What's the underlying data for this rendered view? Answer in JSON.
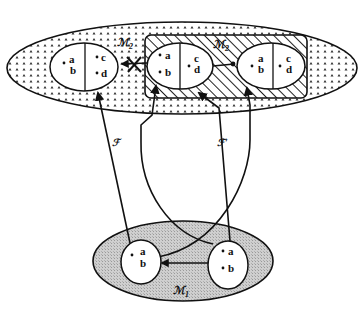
{
  "diagram": {
    "type": "category-functor diagram",
    "top_region": {
      "label": "ℳ₂",
      "label_text": "M2",
      "fill": "dotted",
      "left_object": {
        "left_half": [
          "a",
          "b"
        ],
        "right_half": [
          "c",
          "d"
        ]
      },
      "hatched_subregion": {
        "label": "ℳ₂",
        "label_text": "M2",
        "fill": "hatched",
        "objects": [
          {
            "left_half": [
              "a",
              "b"
            ],
            "right_half": [
              "c",
              "d"
            ]
          },
          {
            "left_half": [
              "a",
              "b"
            ],
            "right_half": [
              "c",
              "d"
            ]
          }
        ]
      },
      "crossed_arrow": "from hatched middle object to left object (crossed out)"
    },
    "bottom_region": {
      "label": "ℳ₁",
      "label_text": "M1",
      "fill": "grey",
      "objects": [
        {
          "elements": [
            "a",
            "b"
          ]
        },
        {
          "elements": [
            "a",
            "b"
          ]
        }
      ]
    },
    "functors": [
      {
        "label": "ℱ",
        "label_text": "F"
      },
      {
        "label": "ℱ′",
        "label_text": "F'"
      }
    ]
  },
  "labels": {
    "m2_outer": "ℳ",
    "m2_outer_sub": "2",
    "m2_inner": "ℳ",
    "m2_inner_sub": "2",
    "m1": "ℳ",
    "m1_sub": "1",
    "f": "ℱ",
    "f_prime": "ℱ′",
    "a": "a",
    "b": "b",
    "c": "c",
    "d": "d"
  }
}
